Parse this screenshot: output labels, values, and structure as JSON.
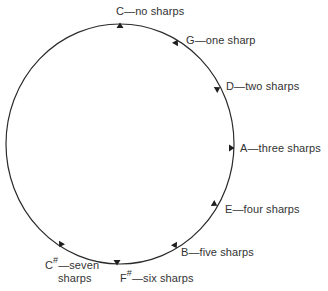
{
  "diagram": {
    "type": "circle-of-fifths-sharps",
    "circle": {
      "cx": 120,
      "cy": 144,
      "rx": 114,
      "ry": 120,
      "stroke": "#2a2a2a"
    },
    "text_color": "#333333",
    "keys": [
      {
        "id": "c",
        "note": "C",
        "sharp": "",
        "dash": "—",
        "text": "no sharps",
        "line2": "",
        "marker": {
          "x": 120,
          "y": 24,
          "angle": 0
        },
        "label": {
          "x": 116,
          "y": 5
        }
      },
      {
        "id": "g",
        "note": "G",
        "sharp": "",
        "dash": "—",
        "text": "one sharp",
        "line2": "",
        "marker": {
          "x": 177,
          "y": 41,
          "angle": 30
        },
        "label": {
          "x": 186,
          "y": 34
        }
      },
      {
        "id": "d",
        "note": "D",
        "sharp": "",
        "dash": "—",
        "text": "two sharps",
        "line2": "",
        "marker": {
          "x": 219,
          "y": 88,
          "angle": 60
        },
        "label": {
          "x": 226,
          "y": 80
        }
      },
      {
        "id": "a",
        "note": "A",
        "sharp": "",
        "dash": "—",
        "text": "three sharps",
        "line2": "",
        "marker": {
          "x": 233,
          "y": 148,
          "angle": 90
        },
        "label": {
          "x": 240,
          "y": 142
        }
      },
      {
        "id": "e",
        "note": "E",
        "sharp": "",
        "dash": "—",
        "text": "four sharps",
        "line2": "",
        "marker": {
          "x": 216,
          "y": 205,
          "angle": 120
        },
        "label": {
          "x": 225,
          "y": 203
        }
      },
      {
        "id": "b",
        "note": "B",
        "sharp": "",
        "dash": "—",
        "text": "five sharps",
        "line2": "",
        "marker": {
          "x": 176,
          "y": 247,
          "angle": 150
        },
        "label": {
          "x": 181,
          "y": 246
        }
      },
      {
        "id": "f-sharp",
        "note": "F",
        "sharp": "#",
        "dash": "—",
        "text": "six sharps",
        "line2": "",
        "marker": {
          "x": 117,
          "y": 264,
          "angle": 180
        },
        "label": {
          "x": 120,
          "y": 272
        }
      },
      {
        "id": "c-sharp",
        "note": "C",
        "sharp": "#",
        "dash": "—",
        "text": "seven",
        "line2": "sharps",
        "marker": {
          "x": 60,
          "y": 246,
          "angle": 210
        },
        "label": {
          "x": 45,
          "y": 259
        }
      }
    ]
  }
}
